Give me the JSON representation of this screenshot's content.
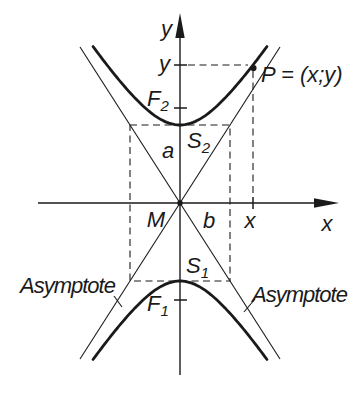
{
  "figure": {
    "type": "hyperbola-with-asymptotes",
    "axis_labels": {
      "y": "y",
      "x": "x"
    },
    "point_p": {
      "label": "P = (x;y)",
      "x_coordinate_label": "x",
      "y_coordinate_label": "y"
    },
    "foci": {
      "upper": {
        "base": "F",
        "sub": "2"
      },
      "lower": {
        "base": "F",
        "sub": "1"
      }
    },
    "vertices": {
      "upper": {
        "base": "S",
        "sub": "2"
      },
      "lower": {
        "base": "S",
        "sub": "1"
      }
    },
    "center_label": "M",
    "semi_axes": {
      "transverse": "a",
      "conjugate": "b"
    },
    "asymptote_labels": {
      "left": "Asymptote",
      "right": "Asymptote"
    }
  },
  "colors": {
    "ink": "#1a1a1a",
    "background": "#ffffff"
  },
  "geometry": {
    "center": {
      "x": 180,
      "y": 203
    },
    "semi_axis_a_px": 78,
    "semi_axis_b_px": 50,
    "curve_half_width_px": 87,
    "asymptote_half_width_px": 100
  }
}
